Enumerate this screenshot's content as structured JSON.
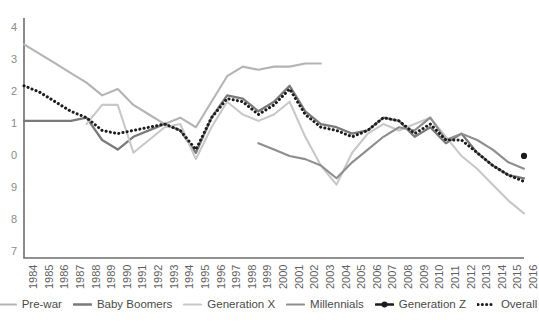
{
  "chart_data": {
    "type": "line",
    "title": "",
    "subtitle": "",
    "xlabel": "",
    "ylabel": "",
    "grid": false,
    "legend_position": "bottom",
    "x": [
      1984,
      1985,
      1986,
      1987,
      1988,
      1989,
      1990,
      1991,
      1992,
      1993,
      1994,
      1995,
      1996,
      1997,
      1998,
      1999,
      2000,
      2001,
      2002,
      2003,
      2004,
      2005,
      2006,
      2007,
      2008,
      2009,
      2010,
      2011,
      2012,
      2013,
      2014,
      2015,
      2016
    ],
    "xtick_labels": [
      "1984",
      "1985",
      "1986",
      "1987",
      "1988",
      "1989",
      "1990",
      "1991",
      "1992",
      "1993",
      "1994",
      "1995",
      "1996",
      "1997",
      "1998",
      "1999",
      "2000",
      "2001",
      "2002",
      "2003",
      "2004",
      "2005",
      "2006",
      "2007",
      "2008",
      "2009",
      "2010",
      "2011",
      "2012",
      "2013",
      "2014",
      "2015",
      "2016"
    ],
    "ytick_labels": [
      "4",
      "3",
      "2",
      "1",
      "0",
      "9",
      "8",
      "7"
    ],
    "ytick_values": [
      1.4,
      1.3,
      1.2,
      1.1,
      1.0,
      0.9,
      0.8,
      0.7
    ],
    "ylim": [
      0.68,
      1.42
    ],
    "xlim": [
      1984,
      2016
    ],
    "series": [
      {
        "name": "Pre-war",
        "color": "#b4b4b4",
        "width": 2.1,
        "dash": "none",
        "marker": "none",
        "x": [
          1984,
          1985,
          1986,
          1987,
          1988,
          1989,
          1990,
          1991,
          1992,
          1993,
          1994,
          1995,
          1996,
          1997,
          1998,
          1999,
          2000,
          2001,
          2002,
          2003
        ],
        "values": [
          1.35,
          1.32,
          1.29,
          1.26,
          1.23,
          1.19,
          1.21,
          1.16,
          1.13,
          1.1,
          1.12,
          1.09,
          1.17,
          1.25,
          1.28,
          1.27,
          1.28,
          1.28,
          1.29,
          1.29
        ]
      },
      {
        "name": "Baby Boomers",
        "color": "#7a7a7a",
        "width": 2.3,
        "dash": "none",
        "marker": "none",
        "x": [
          1984,
          1985,
          1986,
          1987,
          1988,
          1989,
          1990,
          1991,
          1992,
          1993,
          1994,
          1995,
          1996,
          1997,
          1998,
          1999,
          2000,
          2001,
          2002,
          2003,
          2004,
          2005,
          2006,
          2007,
          2008,
          2009,
          2010,
          2011,
          2012,
          2013,
          2014,
          2015,
          2016
        ],
        "values": [
          1.11,
          1.11,
          1.11,
          1.11,
          1.12,
          1.05,
          1.02,
          1.06,
          1.08,
          1.1,
          1.08,
          1.01,
          1.12,
          1.19,
          1.18,
          1.14,
          1.17,
          1.22,
          1.14,
          1.1,
          1.09,
          1.07,
          1.08,
          1.12,
          1.11,
          1.06,
          1.09,
          1.04,
          1.07,
          1.01,
          0.97,
          0.94,
          0.93
        ]
      },
      {
        "name": "Generation X",
        "color": "#c8c8c8",
        "width": 2.1,
        "dash": "none",
        "marker": "none",
        "x": [
          1988,
          1989,
          1990,
          1991,
          1992,
          1993,
          1994,
          1995,
          1996,
          1997,
          1998,
          1999,
          2000,
          2001,
          2002,
          2003,
          2004,
          2005,
          2006,
          2007,
          2008,
          2009,
          2010,
          2011,
          2012,
          2013,
          2014,
          2015,
          2016
        ],
        "values": [
          1.1,
          1.16,
          1.16,
          1.01,
          1.05,
          1.09,
          1.1,
          0.99,
          1.09,
          1.17,
          1.13,
          1.11,
          1.13,
          1.17,
          1.06,
          0.97,
          0.91,
          1.01,
          1.07,
          1.1,
          1.08,
          1.1,
          1.12,
          1.06,
          1.0,
          0.96,
          0.91,
          0.86,
          0.82
        ]
      },
      {
        "name": "Millennials",
        "color": "#8e8e8e",
        "width": 2.1,
        "dash": "none",
        "marker": "none",
        "x": [
          1999,
          2000,
          2001,
          2002,
          2003,
          2004,
          2005,
          2006,
          2007,
          2008,
          2009,
          2010,
          2011,
          2012,
          2013,
          2014,
          2015,
          2016
        ],
        "values": [
          1.04,
          1.02,
          1.0,
          0.99,
          0.97,
          0.93,
          0.98,
          1.02,
          1.06,
          1.09,
          1.08,
          1.12,
          1.05,
          1.07,
          1.05,
          1.02,
          0.98,
          0.96
        ]
      },
      {
        "name": "Generation Z",
        "color": "#1c1c1c",
        "width": 2.4,
        "dash": "none",
        "marker": "dot",
        "x": [
          2016
        ],
        "values": [
          1.0
        ]
      },
      {
        "name": "Overall",
        "color": "#1c1c1c",
        "width": 2.4,
        "dash": "dotted",
        "marker": "none",
        "x": [
          1984,
          1985,
          1986,
          1987,
          1988,
          1989,
          1990,
          1991,
          1992,
          1993,
          1994,
          1995,
          1996,
          1997,
          1998,
          1999,
          2000,
          2001,
          2002,
          2003,
          2004,
          2005,
          2006,
          2007,
          2008,
          2009,
          2010,
          2011,
          2012,
          2013,
          2014,
          2015,
          2016
        ],
        "values": [
          1.22,
          1.2,
          1.17,
          1.14,
          1.12,
          1.08,
          1.07,
          1.08,
          1.09,
          1.1,
          1.08,
          1.02,
          1.12,
          1.18,
          1.17,
          1.13,
          1.16,
          1.21,
          1.13,
          1.09,
          1.08,
          1.06,
          1.08,
          1.12,
          1.11,
          1.07,
          1.1,
          1.05,
          1.05,
          1.01,
          0.97,
          0.94,
          0.92
        ]
      }
    ]
  },
  "legend": {
    "items": [
      {
        "label": "Pre-war",
        "color": "#b4b4b4",
        "style": "solid",
        "marker": "none"
      },
      {
        "label": "Baby Boomers",
        "color": "#7a7a7a",
        "style": "solid",
        "marker": "none"
      },
      {
        "label": "Generation X",
        "color": "#c8c8c8",
        "style": "solid",
        "marker": "none"
      },
      {
        "label": "Millennials",
        "color": "#8e8e8e",
        "style": "solid",
        "marker": "none"
      },
      {
        "label": "Generation Z",
        "color": "#1c1c1c",
        "style": "solid",
        "marker": "dot"
      },
      {
        "label": "Overall",
        "color": "#1c1c1c",
        "style": "dotted",
        "marker": "none"
      }
    ]
  },
  "axis": {
    "axis_color": "#6e6e6e",
    "tick_color": "#5f5f5f"
  }
}
